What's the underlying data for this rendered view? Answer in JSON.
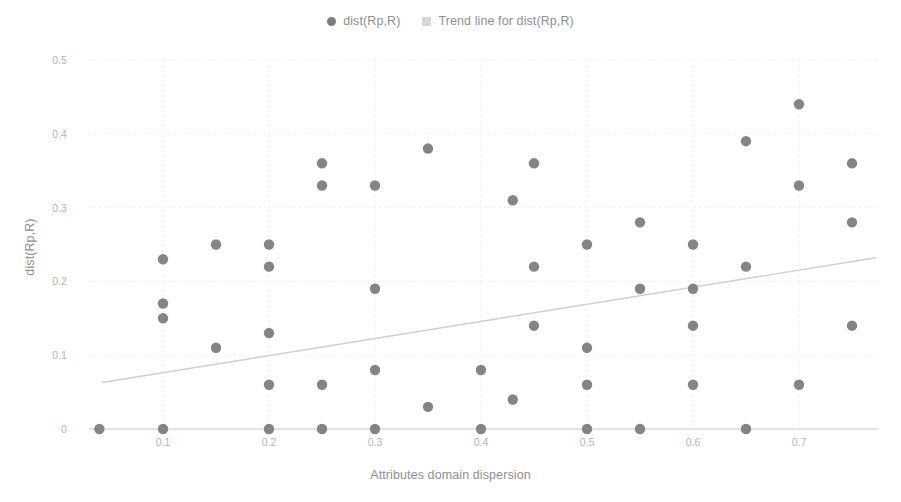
{
  "chart_data": {
    "type": "scatter",
    "title": "",
    "xlabel": "Attributes domain dispersion",
    "ylabel": "dist(Rp,R)",
    "xlim": [
      0.03,
      0.775
    ],
    "ylim": [
      0,
      0.5
    ],
    "grid": true,
    "legend_position": "top-center",
    "xticks": [
      0.1,
      0.2,
      0.3,
      0.4,
      0.5,
      0.6,
      0.7
    ],
    "xtick_labels": [
      "0.1",
      "0.2",
      "0.3",
      "0.4",
      "0.5",
      "0.6",
      "0.7"
    ],
    "yticks": [
      0,
      0.1,
      0.2,
      0.3,
      0.4,
      0.5
    ],
    "ytick_labels": [
      "0",
      "0.1",
      "0.2",
      "0.3",
      "0.4",
      "0.5"
    ],
    "series": [
      {
        "name": "dist(Rp,R)",
        "type": "scatter",
        "color": "#848484",
        "marker": "circle",
        "points": [
          [
            0.04,
            0
          ],
          [
            0.1,
            0.23
          ],
          [
            0.1,
            0.17
          ],
          [
            0.1,
            0.15
          ],
          [
            0.1,
            0
          ],
          [
            0.15,
            0.25
          ],
          [
            0.15,
            0.11
          ],
          [
            0.2,
            0.25
          ],
          [
            0.2,
            0.22
          ],
          [
            0.2,
            0.13
          ],
          [
            0.2,
            0.06
          ],
          [
            0.2,
            0
          ],
          [
            0.25,
            0.36
          ],
          [
            0.25,
            0.33
          ],
          [
            0.25,
            0.06
          ],
          [
            0.25,
            0
          ],
          [
            0.3,
            0.33
          ],
          [
            0.3,
            0.19
          ],
          [
            0.3,
            0.08
          ],
          [
            0.3,
            0
          ],
          [
            0.35,
            0.38
          ],
          [
            0.35,
            0.03
          ],
          [
            0.4,
            0.08
          ],
          [
            0.4,
            0
          ],
          [
            0.43,
            0.31
          ],
          [
            0.43,
            0.04
          ],
          [
            0.45,
            0.36
          ],
          [
            0.45,
            0.22
          ],
          [
            0.45,
            0.14
          ],
          [
            0.5,
            0.25
          ],
          [
            0.5,
            0.11
          ],
          [
            0.5,
            0.06
          ],
          [
            0.5,
            0
          ],
          [
            0.55,
            0.28
          ],
          [
            0.55,
            0.19
          ],
          [
            0.55,
            0
          ],
          [
            0.6,
            0.25
          ],
          [
            0.6,
            0.19
          ],
          [
            0.6,
            0.14
          ],
          [
            0.6,
            0.06
          ],
          [
            0.65,
            0.39
          ],
          [
            0.65,
            0.22
          ],
          [
            0.65,
            0
          ],
          [
            0.7,
            0.44
          ],
          [
            0.7,
            0.33
          ],
          [
            0.7,
            0.06
          ],
          [
            0.75,
            0.36
          ],
          [
            0.75,
            0.28
          ],
          [
            0.75,
            0.14
          ]
        ]
      },
      {
        "name": "Trend line for dist(Rp,R)",
        "type": "line",
        "color": "#cfcfcf",
        "marker": "square",
        "endpoints": [
          [
            0.0425,
            0.063
          ],
          [
            0.7725,
            0.232
          ]
        ]
      }
    ]
  },
  "legend": {
    "items": [
      {
        "label": "dist(Rp,R)",
        "marker": "circle",
        "color": "#7d7d7d"
      },
      {
        "label": "Trend line for dist(Rp,R)",
        "marker": "square",
        "color": "#d6d6d6"
      }
    ]
  },
  "axes": {
    "x_title": "Attributes domain dispersion",
    "y_title": "dist(Rp,R)"
  }
}
